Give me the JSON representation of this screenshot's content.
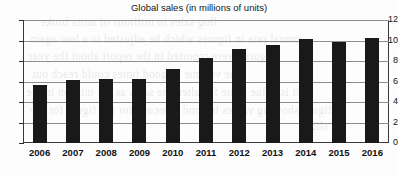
{
  "chart_data": {
    "type": "bar",
    "title": "Global sales (in millions of units)",
    "xlabel": "",
    "ylabel": "",
    "categories": [
      "2006",
      "2007",
      "2008",
      "2009",
      "2010",
      "2011",
      "2012",
      "2013",
      "2014",
      "2015",
      "2016"
    ],
    "values": [
      5.7,
      6.1,
      6.2,
      6.2,
      7.2,
      8.3,
      9.2,
      9.6,
      10.1,
      9.9,
      10.2
    ],
    "ylim": [
      0,
      12
    ],
    "yticks": [
      0,
      2,
      4,
      6,
      8,
      10,
      12
    ],
    "ytick_labels": [
      "0",
      "2",
      "4",
      "6",
      "8",
      "10",
      "12"
    ],
    "grid": true,
    "legend": false,
    "bar_color": "#191919",
    "gridline_color": "#8e8e8e",
    "frame_color": "#3a3a3a"
  },
  "bleed_text": [
    "llog sales in millions of units broke",
    "annual rate in figures which he adjusted to a low again",
    "figures were reported in the report about the year",
    "the volume of good times could reach out",
    "it is value came for alternate sales as the million in the",
    "figure showing values beyond a decade for the figure for the",
    "slight"
  ]
}
